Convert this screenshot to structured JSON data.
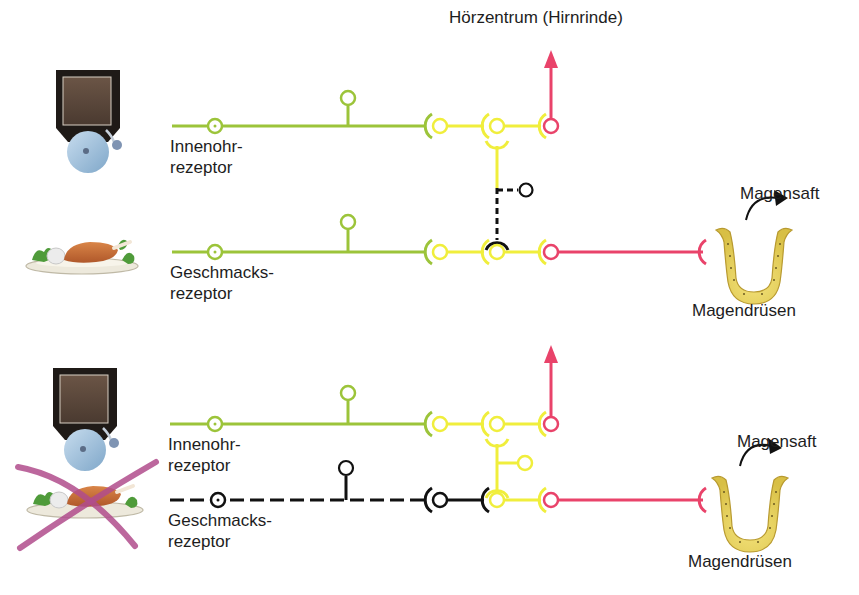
{
  "figure": {
    "colors": {
      "afferent_green": "#9cc43a",
      "interneuron_yellow": "#f0ee3c",
      "efferent_pink": "#e9436a",
      "inactive_black": "#111111",
      "cross_magenta": "#b04c8c",
      "gland_yellow": "#e6d25a"
    },
    "top_panel": {
      "target_label": "Hörzentrum (Hirnrinde)",
      "receptor_1": {
        "line1": "Innenohr-",
        "line2": "rezeptor",
        "icon": "bell-icon"
      },
      "receptor_2": {
        "line1": "Geschmacks-",
        "line2": "rezeptor",
        "icon": "food-plate-icon"
      },
      "secretion_label": "Magensaft",
      "gland_label": "Magendrüsen"
    },
    "bottom_panel": {
      "receptor_1": {
        "line1": "Innenohr-",
        "line2": "rezeptor",
        "icon": "bell-icon"
      },
      "receptor_2": {
        "line1": "Geschmacks-",
        "line2": "rezeptor",
        "icon": "crossed-out-food-plate-icon",
        "state": "inactive"
      },
      "secretion_label": "Magensaft",
      "gland_label": "Magendrüsen"
    }
  }
}
